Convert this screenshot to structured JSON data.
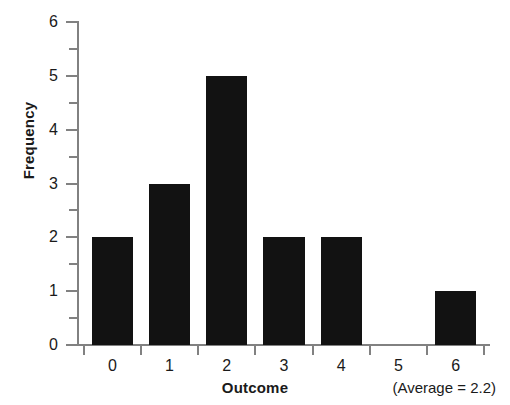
{
  "chart_data": {
    "type": "bar",
    "title": "",
    "xlabel": "Outcome",
    "ylabel": "Frequency",
    "categories": [
      "0",
      "1",
      "2",
      "3",
      "4",
      "5",
      "6"
    ],
    "values": [
      2,
      3,
      5,
      2,
      2,
      0,
      1
    ],
    "ylim": [
      0,
      6
    ],
    "xlim": [
      -0.6,
      6.6
    ],
    "y_major_ticks": [
      0,
      1,
      2,
      3,
      4,
      5,
      6
    ],
    "y_minor_ticks": [
      0.5,
      1.5,
      2.5,
      3.5,
      4.5,
      5.5
    ],
    "y_tick_labels": [
      "0",
      "1",
      "2",
      "3",
      "4",
      "5",
      "6"
    ],
    "x_tick_labels": [
      "0",
      "1",
      "2",
      "3",
      "4",
      "5",
      "6"
    ],
    "grid": false,
    "legend": null,
    "annotations": [
      {
        "name": "average-note",
        "text": "(Average = 2.2)",
        "value": 2.2,
        "position": "below-axis-right"
      }
    ],
    "colors": {
      "bar": "#121212",
      "axis": "#818181",
      "text": "#1a1a1a",
      "background": "#ffffff"
    }
  }
}
